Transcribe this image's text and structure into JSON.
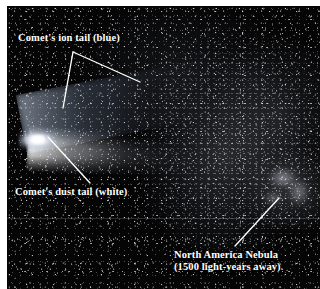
{
  "figure": {
    "kind": "annotated-astrophotograph",
    "background_color": "#050506",
    "label_color": "#ffffff",
    "leader_line_color": "#ffffff",
    "page_background": "#ffffff"
  },
  "annotations": [
    {
      "id": "ion-tail",
      "text": "Comet's ion tail (blue)",
      "leader_apex": [
        73,
        52
      ],
      "leader_endpoints": [
        [
          63,
          108
        ],
        [
          140,
          82
        ]
      ]
    },
    {
      "id": "dust-tail",
      "text": "Comet's dust tail (white)",
      "leader_endpoints": [
        [
          48,
          137
        ],
        [
          90,
          183
        ]
      ]
    },
    {
      "id": "north-america-nebula",
      "text_line1": "North America Nebula",
      "text_line2": "(1500 light-years away)",
      "distance_value": "1500",
      "distance_units": "light-years",
      "leader_endpoints": [
        [
          235,
          246
        ],
        [
          279,
          198
        ]
      ]
    }
  ],
  "features": {
    "coma_label": "comet coma and nucleus",
    "ion_tail_label": "ion tail",
    "dust_tail_label": "dust tail",
    "milky_way_label": "Milky Way star field",
    "nebula_label": "North America Nebula"
  }
}
